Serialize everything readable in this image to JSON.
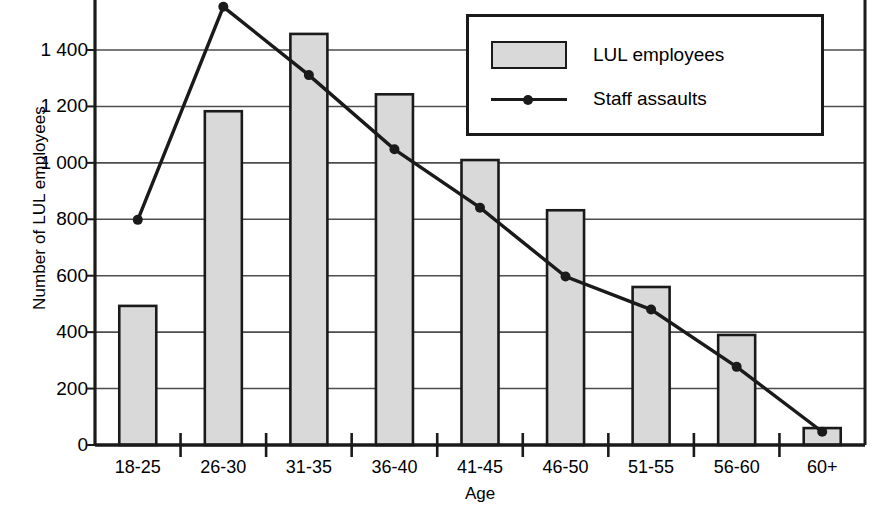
{
  "chart_data": {
    "type": "bar",
    "title": "",
    "xlabel": "Age",
    "ylabel": "Number of LUL employees",
    "categories": [
      "18-25",
      "26-30",
      "31-35",
      "36-40",
      "41-45",
      "46-50",
      "51-55",
      "56-60",
      "60+"
    ],
    "ylim": [
      0,
      1560
    ],
    "yticks": [
      0,
      200,
      400,
      600,
      800,
      1000,
      1200,
      1400
    ],
    "ytick_labels": [
      "0",
      "200",
      "400",
      "600",
      "800",
      "1 000",
      "1 200",
      "1 400"
    ],
    "grid": true,
    "legend_position": "top-right",
    "series": [
      {
        "name": "LUL employees",
        "type": "bar",
        "values": [
          493,
          1183,
          1457,
          1243,
          1010,
          832,
          560,
          390,
          60
        ]
      },
      {
        "name": "Staff assaults",
        "type": "line",
        "values": [
          798,
          1553,
          1311,
          1048,
          841,
          597,
          480,
          277,
          47
        ]
      }
    ]
  },
  "legend": {
    "items": [
      {
        "label": "LUL employees",
        "marker": "filled-rect",
        "color": "#d9d9d9"
      },
      {
        "label": "Staff assaults",
        "marker": "line-dot",
        "color": "#1a1a1a"
      }
    ]
  },
  "colors": {
    "bar_fill": "#d9d9d9",
    "bar_stroke": "#1a1a1a",
    "line": "#1a1a1a",
    "axis": "#1a1a1a",
    "grid": "#4d4d4d",
    "background": "#ffffff"
  }
}
